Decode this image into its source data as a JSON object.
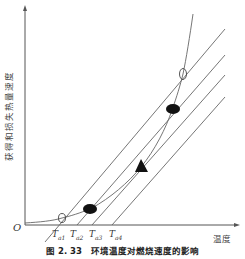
{
  "figure": {
    "caption": "图 2. 33　环境温度对燃烧速度的影响",
    "y_axis_label": "获得和损失热量速度",
    "x_axis_label": "温度",
    "origin_label": "O",
    "ticks": [
      {
        "label": "T",
        "sub": "a1"
      },
      {
        "label": "T",
        "sub": "a2"
      },
      {
        "label": "T",
        "sub": "a3"
      },
      {
        "label": "T",
        "sub": "a4"
      }
    ],
    "markers": [
      {
        "type": "open-circle",
        "desc": "tangent/intersection at Ta1 line, low"
      },
      {
        "type": "filled-ellipse",
        "desc": "stable point on Ta2 line"
      },
      {
        "type": "filled-triangle",
        "desc": "tangent point on Ta3 line"
      },
      {
        "type": "filled-ellipse",
        "desc": "upper point on Ta2 line"
      },
      {
        "type": "open-circle",
        "desc": "upper intersection on Ta1 line"
      }
    ],
    "colors": {
      "line": "#555555",
      "marker": "#111111",
      "background": "#ffffff"
    }
  }
}
